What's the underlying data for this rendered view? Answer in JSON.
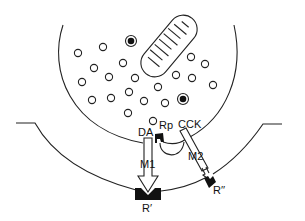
{
  "diagram": {
    "type": "synapse-schematic",
    "labels": {
      "da": "DA",
      "rp": "Rp",
      "cck": "CCK",
      "m1": "M1",
      "m2": "M2",
      "r_prime": "R′",
      "r_double_prime": "R′′"
    },
    "colors": {
      "line": "#222222",
      "fill_dark": "#111111",
      "background": "#ffffff"
    },
    "small_vesicles": [
      [
        78,
        53
      ],
      [
        103,
        47
      ],
      [
        94,
        68
      ],
      [
        123,
        63
      ],
      [
        82,
        82
      ],
      [
        109,
        77
      ],
      [
        135,
        78
      ],
      [
        92,
        100
      ],
      [
        111,
        98
      ],
      [
        129,
        92
      ],
      [
        144,
        101
      ],
      [
        128,
        113
      ],
      [
        153,
        121
      ],
      [
        191,
        57
      ],
      [
        205,
        64
      ],
      [
        176,
        75
      ],
      [
        192,
        78
      ],
      [
        213,
        85
      ],
      [
        158,
        87
      ],
      [
        165,
        103
      ]
    ],
    "dense_core_vesicles": [
      [
        131,
        41
      ],
      [
        183,
        99
      ]
    ]
  }
}
